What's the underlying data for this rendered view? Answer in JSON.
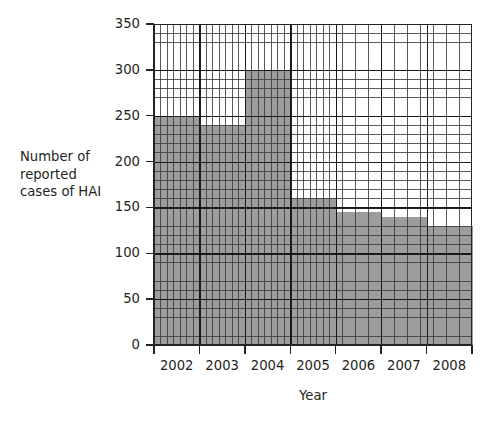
{
  "chart_data": {
    "type": "bar",
    "title": "",
    "subtitle": "",
    "xlabel": "Year",
    "ylabel": "Number of reported cases of HAI",
    "ylabel_lines": [
      "Number of",
      "reported",
      "cases of HAI"
    ],
    "categories": [
      "2002",
      "2003",
      "2004",
      "2005",
      "2006",
      "2007",
      "2008"
    ],
    "values": [
      250,
      240,
      300,
      160,
      145,
      140,
      130
    ],
    "ylim": [
      0,
      350
    ],
    "ytick_values": [
      0,
      50,
      100,
      150,
      200,
      250,
      300,
      350
    ],
    "ytick_labels": [
      "0",
      "50",
      "100",
      "150",
      "200",
      "250",
      "300",
      "350"
    ],
    "ymajor_step": 50,
    "yminor_step": 10,
    "xminor_divisions_per_category": 7,
    "grid": true,
    "grid_minor": true,
    "legend": "none",
    "bar_color": "#9d9d9d",
    "grid_color": "#3c3c3c",
    "axis_color": "#242424",
    "background_color": "#ffffff",
    "bars_contiguous": true,
    "annotations": []
  },
  "axes": {
    "y": {
      "label_line_1": "Number of",
      "label_line_2": "reported",
      "label_line_3": "cases of HAI",
      "ticks": [
        {
          "value": 350,
          "label": "350"
        },
        {
          "value": 300,
          "label": "300"
        },
        {
          "value": 250,
          "label": "250"
        },
        {
          "value": 200,
          "label": "200"
        },
        {
          "value": 150,
          "label": "150"
        },
        {
          "value": 100,
          "label": "100"
        },
        {
          "value": 50,
          "label": "50"
        },
        {
          "value": 0,
          "label": "0"
        }
      ]
    },
    "x": {
      "label": "Year",
      "ticks": [
        {
          "label": "2002"
        },
        {
          "label": "2003"
        },
        {
          "label": "2004"
        },
        {
          "label": "2005"
        },
        {
          "label": "2006"
        },
        {
          "label": "2007"
        },
        {
          "label": "2008"
        }
      ]
    }
  }
}
